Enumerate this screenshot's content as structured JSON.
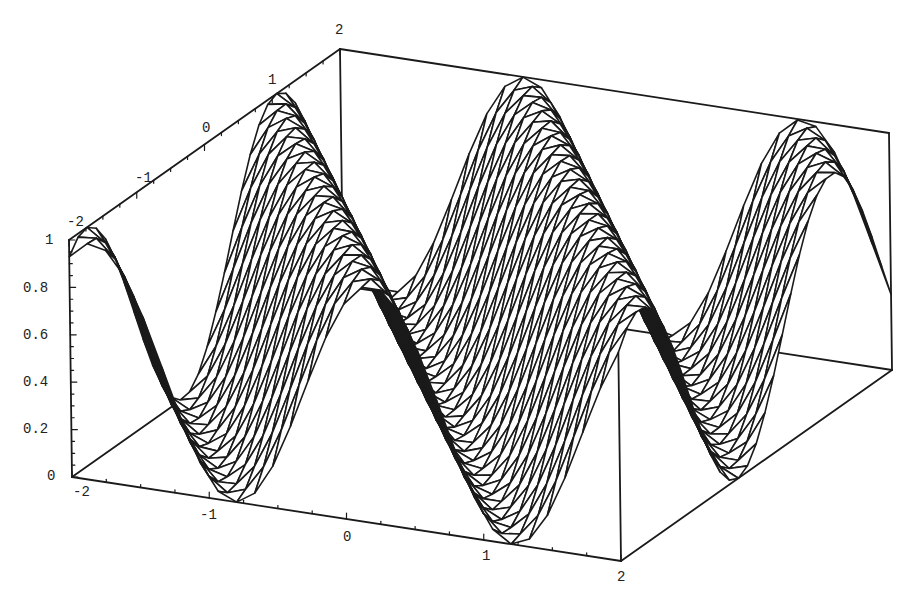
{
  "chart_data": {
    "type": "surface3d",
    "title": "",
    "xlabel": "",
    "ylabel": "",
    "zlabel": "",
    "x_range": [
      -2,
      2
    ],
    "y_range": [
      -2,
      2
    ],
    "z_range": [
      0,
      1
    ],
    "function_description": "periodic wave surface, z = sin^2(k*(x + c*y)), values between 0 and 1",
    "function_params": {
      "k": 1.55,
      "c": 0.72,
      "phase": 0.35
    },
    "mesh": {
      "nx": 30,
      "ny": 30
    },
    "style": {
      "line_color": "#1a1a1a",
      "fill_color": "#ffffff",
      "box_color": "#1a1a1a",
      "line_width": 1.6
    },
    "projection": {
      "origin": [
        72,
        477
      ],
      "x_unit": [
        137.25,
        21.0
      ],
      "y_unit": [
        67.75,
        -47.75
      ],
      "z_unit": [
        -3.0,
        -237.0
      ]
    },
    "x_ticks": [
      {
        "label": "-2",
        "pos": [
          78,
          492
        ]
      },
      {
        "label": "-1",
        "pos": [
          205,
          515
        ]
      },
      {
        "label": "0",
        "pos": [
          348,
          537
        ]
      },
      {
        "label": "1",
        "pos": [
          487,
          556
        ]
      },
      {
        "label": "2",
        "pos": [
          622,
          577
        ]
      }
    ],
    "y_ticks": [
      {
        "label": "-2",
        "pos": [
          72,
          222
        ]
      },
      {
        "label": "-1",
        "pos": [
          140,
          178
        ]
      },
      {
        "label": "0",
        "pos": [
          207,
          128
        ]
      },
      {
        "label": "1",
        "pos": [
          273,
          80
        ]
      },
      {
        "label": "2",
        "pos": [
          340,
          30
        ]
      }
    ],
    "z_ticks": [
      {
        "label": "0",
        "pos": [
          52,
          476
        ]
      },
      {
        "label": "0.2",
        "pos": [
          28,
          429
        ]
      },
      {
        "label": "0.4",
        "pos": [
          28,
          382
        ]
      },
      {
        "label": "0.6",
        "pos": [
          28,
          335
        ]
      },
      {
        "label": "0.8",
        "pos": [
          28,
          288
        ]
      },
      {
        "label": "1",
        "pos": [
          50,
          240
        ]
      }
    ],
    "grid": false,
    "legend": null
  }
}
